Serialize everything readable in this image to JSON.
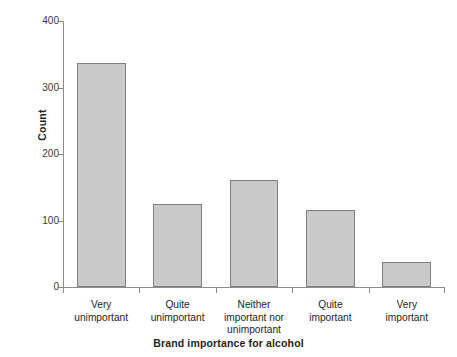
{
  "chart_data": {
    "type": "bar",
    "title": "",
    "xlabel": "Brand importance for alcohol",
    "ylabel": "Count",
    "categories": [
      "Very\nunimportant",
      "Quite\nunimportant",
      "Neither\nimportant nor\nunimportant",
      "Quite\nimportant",
      "Very\nimportant"
    ],
    "values": [
      337,
      125,
      161,
      116,
      38
    ],
    "ylim": [
      0,
      400
    ],
    "yticks": [
      0,
      100,
      200,
      300,
      400
    ],
    "ytick_labels": [
      "0",
      "100",
      "200",
      "300",
      "400"
    ],
    "grid": false,
    "legend": false,
    "bar_fill_color": "#c9c9c9",
    "bar_edge_color": "#808080",
    "axis_color": "#8c8c8c",
    "background_color": "#ffffff"
  }
}
